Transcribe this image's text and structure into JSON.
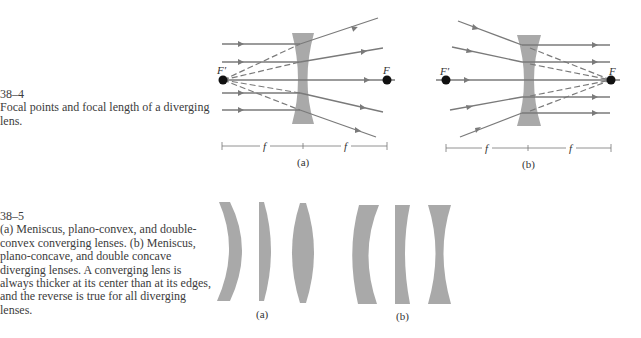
{
  "figures": [
    {
      "number": "38–4",
      "caption": "Focal points and focal length of a diverging lens.",
      "panels": [
        {
          "label": "(a)",
          "focal_left": "F′",
          "focal_right": "F",
          "distance_left": "f",
          "distance_right": "f"
        },
        {
          "label": "(b)",
          "focal_left": "F′",
          "focal_right": "F",
          "distance_left": "f",
          "distance_right": "f"
        }
      ]
    },
    {
      "number": "38–5",
      "caption": "(a) Meniscus, plano-convex, and double-convex converging lenses. (b) Meniscus, plano-concave, and double concave diverging lenses. A converging lens is always thicker at its center than at its edges, and the reverse is true for all diverging lenses.",
      "groups": [
        {
          "label": "(a)",
          "lenses": [
            "meniscus-converging",
            "plano-convex",
            "double-convex"
          ]
        },
        {
          "label": "(b)",
          "lenses": [
            "meniscus-diverging",
            "plano-concave",
            "double-concave"
          ]
        }
      ]
    }
  ],
  "colors": {
    "lens": "#a9a9a9",
    "ray": "#7a7a7a",
    "point": "#111111"
  }
}
